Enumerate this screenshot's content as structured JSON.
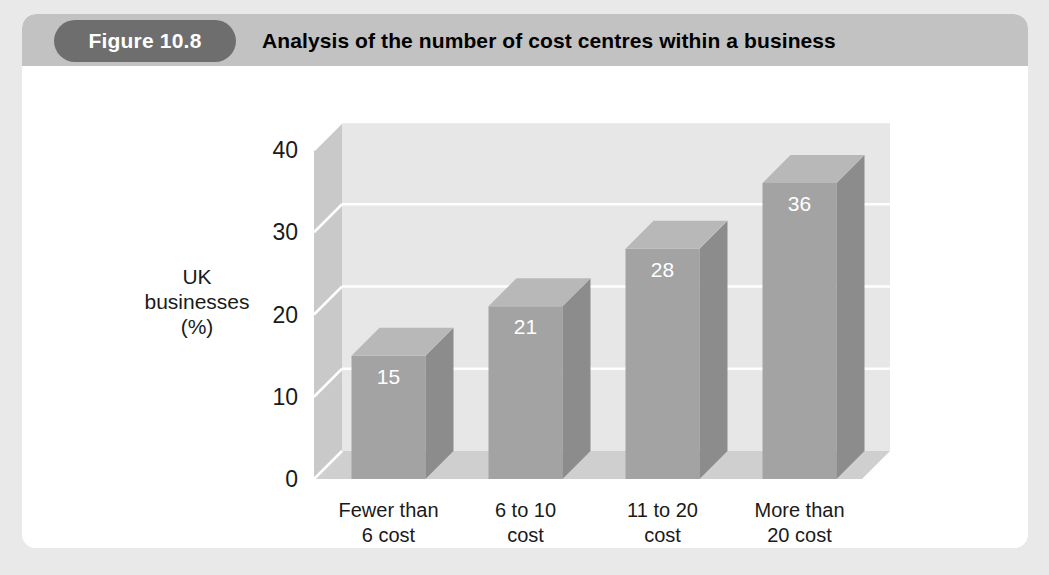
{
  "figure": {
    "badge_label": "Figure 10.8",
    "title": "Analysis of the number of cost centres within a business"
  },
  "chart_data": {
    "type": "bar",
    "title": "Analysis of the number of cost centres within a business",
    "categories": [
      "Fewer than\n6 cost\ncentres",
      "6 to 10\ncost\ncentres",
      "11 to 20\ncost\ncentres",
      "More than\n20 cost\ncentres"
    ],
    "category_lines": [
      [
        "Fewer than",
        "6 cost",
        "centres"
      ],
      [
        "6 to 10",
        "cost",
        "centres"
      ],
      [
        "11 to 20",
        "cost",
        "centres"
      ],
      [
        "More than",
        "20 cost",
        "centres"
      ]
    ],
    "values": [
      15,
      21,
      28,
      36
    ],
    "value_labels": [
      "15",
      "21",
      "28",
      "36"
    ],
    "xlabel": "",
    "ylabel": "UK businesses (%)",
    "ylabel_lines": [
      "UK",
      "businesses",
      "(%)"
    ],
    "ylim": [
      0,
      40
    ],
    "yticks": [
      0,
      10,
      20,
      30,
      40
    ],
    "ytick_labels": [
      "0",
      "10",
      "20",
      "30",
      "40"
    ],
    "grid": true,
    "legend": "none",
    "style": "3d",
    "colors": {
      "bar_front": "#a3a3a3",
      "bar_side": "#8c8c8c",
      "bar_top": "#b8b8b8",
      "back_wall": "#e7e7e7",
      "side_wall": "#c9c9c9",
      "floor": "#cfcfcf",
      "gridline": "#ffffff",
      "header_band": "#c2c2c2",
      "badge": "#6e6e6e",
      "card": "#ffffff",
      "page_background": "#e9e9e9",
      "text": "#1a1a1a",
      "value_text": "#ffffff"
    }
  }
}
